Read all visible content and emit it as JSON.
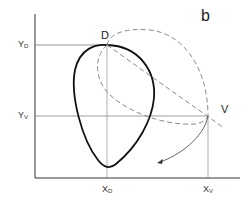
{
  "figure": {
    "panel_label": "b",
    "points": {
      "D": {
        "label": "D"
      },
      "V": {
        "label": "V"
      }
    },
    "axis_labels": {
      "y_d": {
        "main": "Y",
        "sub": "D"
      },
      "y_v": {
        "main": "Y",
        "sub": "V"
      },
      "x_d": {
        "main": "X",
        "sub": "D"
      },
      "x_v": {
        "main": "X",
        "sub": "V"
      }
    },
    "colors": {
      "axis": "#333333",
      "guide": "#888888",
      "solid_curve": "#111111",
      "dashed_curve": "#8a8a8a",
      "arrow_curve": "#555555"
    }
  }
}
